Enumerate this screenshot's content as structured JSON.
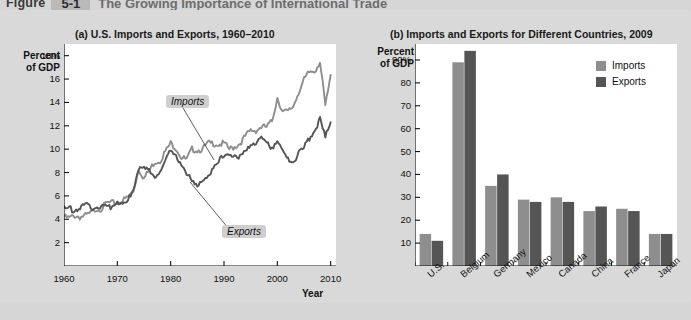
{
  "figure": {
    "label": "Figure",
    "number": "5-1",
    "title": "The Growing Importance of International Trade"
  },
  "colors": {
    "imports": "#8e8e8e",
    "exports": "#555555",
    "plot_bg": "#ffffff",
    "panel_bg": "#d9d9d9",
    "page_bg": "#d6d6d6",
    "axis": "#111111",
    "callout_bg": "#cfcfcf"
  },
  "panel_a": {
    "title": "(a) U.S. Imports and Exports, 1960–2010",
    "y_caption": "Percent\nof GDP",
    "y_caption_line1": "Percent",
    "y_caption_line2": "of GDP",
    "x_label": "Year",
    "y_ticks": [
      "18%",
      "16",
      "14",
      "12",
      "10",
      "8",
      "6",
      "4",
      "2"
    ],
    "x_ticks": [
      "1960",
      "1970",
      "1980",
      "1990",
      "2000",
      "2010"
    ],
    "callouts": [
      {
        "name": "imports",
        "text": "Imports"
      },
      {
        "name": "exports",
        "text": "Exports"
      }
    ]
  },
  "panel_b": {
    "title": "(b) Imports and Exports for Different Countries, 2009",
    "y_caption_line1": "Percent",
    "y_caption_line2": "of GDP",
    "y_ticks": [
      "90%",
      "80",
      "70",
      "60",
      "50",
      "40",
      "30",
      "20",
      "10"
    ],
    "legend": [
      {
        "label": "Imports",
        "color": "#8e8e8e"
      },
      {
        "label": "Exports",
        "color": "#555555"
      }
    ]
  },
  "chart_data": [
    {
      "type": "line",
      "id": "panel-a",
      "title": "(a) U.S. Imports and Exports, 1960–2010",
      "xlabel": "Year",
      "ylabel": "Percent of GDP",
      "xlim": [
        1960,
        2011
      ],
      "ylim": [
        0,
        19
      ],
      "y_ticks": [
        2,
        4,
        6,
        8,
        10,
        12,
        14,
        16,
        18
      ],
      "x_ticks": [
        1960,
        1970,
        1980,
        1990,
        2000,
        2010
      ],
      "grid": false,
      "legend": "annotated-inline",
      "annotations": [
        "Imports",
        "Exports"
      ],
      "x": [
        1960,
        1961,
        1962,
        1963,
        1964,
        1965,
        1966,
        1967,
        1968,
        1969,
        1970,
        1971,
        1972,
        1973,
        1974,
        1975,
        1976,
        1977,
        1978,
        1979,
        1980,
        1981,
        1982,
        1983,
        1984,
        1985,
        1986,
        1987,
        1988,
        1989,
        1990,
        1991,
        1992,
        1993,
        1994,
        1995,
        1996,
        1997,
        1998,
        1999,
        2000,
        2001,
        2002,
        2003,
        2004,
        2005,
        2006,
        2007,
        2008,
        2009,
        2010
      ],
      "series": [
        {
          "name": "Imports",
          "color": "#8e8e8e",
          "values": [
            4.2,
            4.1,
            4.3,
            4.2,
            4.3,
            4.5,
            4.9,
            4.9,
            5.4,
            5.4,
            5.4,
            5.6,
            5.9,
            6.4,
            8.3,
            7.5,
            8.2,
            8.9,
            9.0,
            9.8,
            10.5,
            10.1,
            9.3,
            9.1,
            10.0,
            9.9,
            10.0,
            10.5,
            10.5,
            10.4,
            10.5,
            10.0,
            10.2,
            10.5,
            11.1,
            11.6,
            11.6,
            11.9,
            11.9,
            12.4,
            14.4,
            13.2,
            13.2,
            13.7,
            14.9,
            15.9,
            16.6,
            16.7,
            17.5,
            13.7,
            16.2
          ]
        },
        {
          "name": "Exports",
          "color": "#555555",
          "values": [
            4.9,
            4.9,
            4.8,
            5.0,
            5.2,
            5.0,
            5.1,
            5.0,
            5.1,
            5.1,
            5.6,
            5.3,
            5.5,
            6.7,
            8.4,
            8.3,
            8.1,
            7.7,
            8.0,
            8.9,
            10.0,
            9.6,
            8.6,
            7.7,
            7.4,
            7.0,
            7.1,
            7.5,
            8.6,
            9.1,
            9.3,
            9.6,
            9.5,
            9.3,
            9.7,
            10.4,
            10.6,
            11.0,
            10.5,
            10.2,
            10.7,
            9.7,
            9.1,
            9.0,
            9.6,
            10.1,
            10.9,
            11.6,
            12.5,
            11.0,
            12.5
          ]
        }
      ]
    },
    {
      "type": "bar",
      "id": "panel-b",
      "title": "(b) Imports and Exports for Different Countries, 2009",
      "xlabel": "",
      "ylabel": "Percent of GDP",
      "ylim": [
        0,
        97
      ],
      "y_ticks": [
        10,
        20,
        30,
        40,
        50,
        60,
        70,
        80,
        90
      ],
      "grid": false,
      "legend_position": "top-right",
      "categories": [
        "U.S.",
        "Belgium",
        "Germany",
        "Mexico",
        "Canada",
        "China",
        "France",
        "Japan"
      ],
      "series": [
        {
          "name": "Imports",
          "color": "#8e8e8e",
          "values": [
            14,
            89,
            35,
            29,
            30,
            24,
            25,
            14
          ]
        },
        {
          "name": "Exports",
          "color": "#555555",
          "values": [
            11,
            94,
            40,
            28,
            28,
            26,
            24,
            14
          ]
        }
      ]
    }
  ]
}
